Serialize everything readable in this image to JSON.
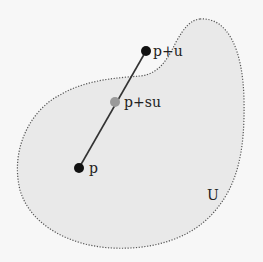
{
  "diagram": {
    "region": {
      "label": "U",
      "fill": "#e9e9e9",
      "stroke": "#555555",
      "stroke_style": "dotted"
    },
    "segment": {
      "from": "p",
      "to": "p+u",
      "stroke": "#333333"
    },
    "points": [
      {
        "id": "p_plus_u",
        "label": "p+u",
        "color": "#111111"
      },
      {
        "id": "p_plus_su",
        "label": "p+su",
        "color": "#999999"
      },
      {
        "id": "p",
        "label": "p",
        "color": "#111111"
      }
    ]
  }
}
